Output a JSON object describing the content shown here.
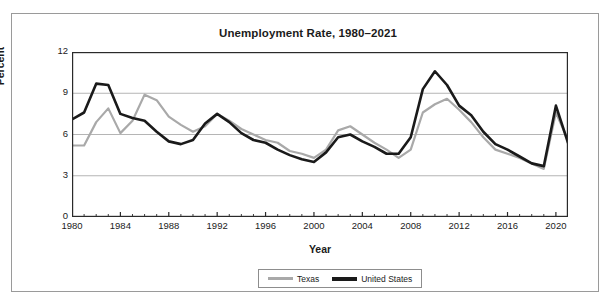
{
  "chart_data": {
    "type": "line",
    "title": "Unemployment Rate, 1980–2021",
    "xlabel": "Year",
    "ylabel": "Percent",
    "ylim": [
      0,
      12
    ],
    "xlim": [
      1980,
      2021
    ],
    "yticks": [
      0,
      3,
      6,
      9,
      12
    ],
    "xticks": [
      1980,
      1984,
      1988,
      1992,
      1996,
      2000,
      2004,
      2008,
      2012,
      2016,
      2020
    ],
    "grid": "horizontal",
    "legend_position": "bottom",
    "x": [
      1980,
      1981,
      1982,
      1983,
      1984,
      1985,
      1986,
      1987,
      1988,
      1989,
      1990,
      1991,
      1992,
      1993,
      1994,
      1995,
      1996,
      1997,
      1998,
      1999,
      2000,
      2001,
      2002,
      2003,
      2004,
      2005,
      2006,
      2007,
      2008,
      2009,
      2010,
      2011,
      2012,
      2013,
      2014,
      2015,
      2016,
      2017,
      2018,
      2019,
      2020,
      2021
    ],
    "series": [
      {
        "name": "Texas",
        "color": "#a9a9a9",
        "values": [
          5.2,
          5.2,
          6.9,
          7.9,
          6.1,
          7.0,
          8.9,
          8.5,
          7.3,
          6.7,
          6.2,
          6.6,
          7.5,
          7.0,
          6.4,
          6.0,
          5.6,
          5.4,
          4.8,
          4.6,
          4.3,
          4.9,
          6.3,
          6.6,
          6.0,
          5.4,
          4.9,
          4.3,
          4.9,
          7.6,
          8.2,
          8.6,
          7.8,
          6.9,
          5.8,
          4.9,
          4.6,
          4.3,
          3.9,
          3.5,
          7.6,
          5.6
        ]
      },
      {
        "name": "United States",
        "color": "#1a1a1a",
        "values": [
          7.1,
          7.6,
          9.7,
          9.6,
          7.5,
          7.2,
          7.0,
          6.2,
          5.5,
          5.3,
          5.6,
          6.8,
          7.5,
          6.9,
          6.1,
          5.6,
          5.4,
          4.9,
          4.5,
          4.2,
          4.0,
          4.7,
          5.8,
          6.0,
          5.5,
          5.1,
          4.6,
          4.6,
          5.8,
          9.3,
          10.6,
          9.6,
          8.1,
          7.4,
          6.2,
          5.3,
          4.9,
          4.4,
          3.9,
          3.7,
          8.1,
          5.4
        ]
      }
    ]
  },
  "legend": {
    "entries": [
      {
        "label": "Texas"
      },
      {
        "label": "United States"
      }
    ]
  }
}
